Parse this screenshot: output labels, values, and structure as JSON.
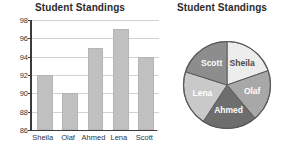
{
  "chart_data": [
    {
      "type": "bar",
      "title": "Student Standings",
      "categories": [
        "Sheila",
        "Olaf",
        "Ahmed",
        "Lena",
        "Scott"
      ],
      "values": [
        92,
        90,
        95,
        97,
        94
      ],
      "xlabel": "",
      "ylabel": "",
      "ylim": [
        86,
        98
      ],
      "yticks": [
        86,
        88,
        90,
        92,
        94,
        96,
        98
      ],
      "grid": true,
      "legend": "none",
      "bar_color": "#c0c0c0"
    },
    {
      "type": "pie",
      "title": "Student Standings",
      "labels": [
        "Sheila",
        "Olaf",
        "Ahmed",
        "Lena",
        "Scott"
      ],
      "values": [
        92,
        90,
        95,
        97,
        94
      ],
      "slice_colors": [
        "#ededed",
        "#a8a8a8",
        "#6e6e6e",
        "#c9c9c9",
        "#8d8d8d"
      ],
      "label_text_colors": [
        "#4a4a4a",
        "#ffffff",
        "#ffffff",
        "#ffffff",
        "#ffffff"
      ],
      "start_angle_deg": 0,
      "direction": "clockwise",
      "legend": "none",
      "outline_color": "#5a5a5a"
    }
  ],
  "bar_chart": {
    "title": "Student Standings",
    "y_ticks": [
      "98",
      "96",
      "94",
      "92",
      "90",
      "88",
      "86"
    ],
    "x_labels": [
      "Sheila",
      "Olaf",
      "Ahmed",
      "Lena",
      "Scott"
    ]
  },
  "pie_chart": {
    "title": "Student Standings",
    "labels": [
      "Sheila",
      "Olaf",
      "Ahmed",
      "Lena",
      "Scott"
    ]
  }
}
